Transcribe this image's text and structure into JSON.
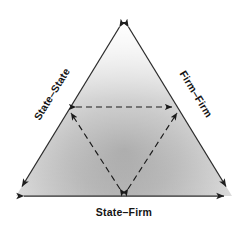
{
  "figure": {
    "type": "triangle-relationship-diagram",
    "background_color": "#ffffff",
    "outline_color": "#2b2b2b",
    "dashed_color": "#1a1a1a",
    "label_color": "#141414",
    "fill_light": "#fbfbfb",
    "fill_mid": "#c9c9c9",
    "fill_dark": "#9b9b9b"
  },
  "labels": {
    "left_edge": "State–State",
    "right_edge": "Firm–Firm",
    "bottom_edge": "State–Firm"
  },
  "geometry": {
    "outer_triangle": {
      "apex": [
        124,
        20
      ],
      "bottom_left": [
        16,
        196
      ],
      "bottom_right": [
        232,
        196
      ]
    },
    "inner_triangle": {
      "left": [
        68,
        107
      ],
      "right": [
        180,
        107
      ],
      "bottom": [
        124,
        196
      ]
    }
  }
}
